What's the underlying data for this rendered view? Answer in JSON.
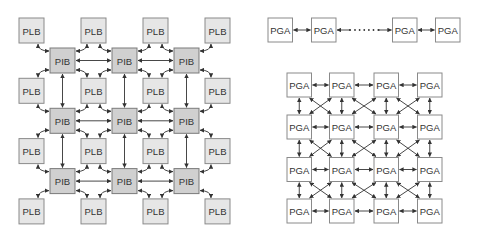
{
  "diagrams": [
    {
      "id": "fpga-island",
      "description": "Island-style architecture: logic blocks interconnected through interconnect blocks",
      "node_types": {
        "logic_block": {
          "label": "PLB",
          "fill": "#e6e6e6"
        },
        "interconnect_block": {
          "label": "PIB",
          "fill": "#d0d0d0"
        }
      },
      "logic_grid": {
        "rows": 4,
        "cols": 4
      },
      "interconnect_grid": {
        "rows": 3,
        "cols": 3
      },
      "connections": [
        "PLB corners linked to adjacent PIB corners with curved bidirectional arrows",
        "PIB to PIB horizontal bidirectional arrows",
        "PIB to PIB vertical bidirectional arrows"
      ]
    },
    {
      "id": "pga-chain",
      "description": "Linear chain of PGA blocks with bidirectional links and ellipsis",
      "node_label": "PGA",
      "left_nodes": 2,
      "right_nodes": 2,
      "ellipsis": "·····"
    },
    {
      "id": "pga-mesh",
      "description": "4x4 mesh of PGA blocks with horizontal, vertical and diagonal bidirectional links",
      "node_label": "PGA",
      "grid": {
        "rows": 4,
        "cols": 4
      },
      "connections": [
        "horizontal",
        "vertical",
        "diagonal-cross"
      ]
    }
  ],
  "colors": {
    "logic_block_fill": "#e6e6e6",
    "interconnect_block_fill": "#d0d0d0",
    "pga_fill": "#ffffff",
    "border": "#8a8a8a",
    "arrow": "#333333",
    "text": "#333333"
  }
}
